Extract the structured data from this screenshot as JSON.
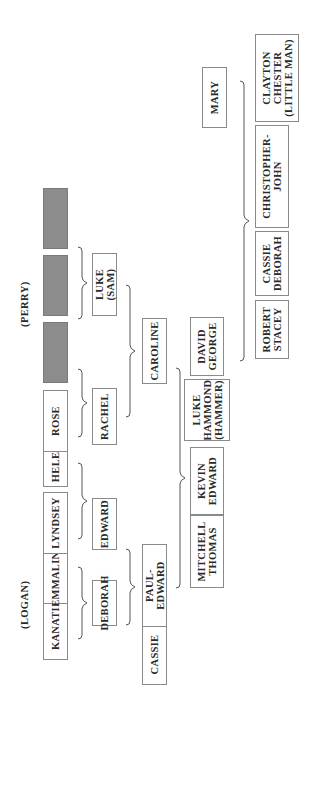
{
  "family_labels": {
    "logan": "(LOGAN)",
    "perry": "(PERRY)"
  },
  "generation_1": [
    {
      "id": "kanati",
      "label": "KANATI"
    },
    {
      "id": "emmaline",
      "label": "EMMALINE"
    },
    {
      "id": "lyndsey",
      "label": "LYNDSEY"
    },
    {
      "id": "helen",
      "label": "HELEN"
    },
    {
      "id": "rose",
      "label": "ROSE"
    },
    {
      "id": "unknown-1",
      "label": ""
    },
    {
      "id": "unknown-2",
      "label": ""
    },
    {
      "id": "unknown-3",
      "label": ""
    }
  ],
  "generation_2": [
    {
      "id": "deborah",
      "label": "DEBORAH"
    },
    {
      "id": "edward",
      "label": "EDWARD"
    },
    {
      "id": "rachel",
      "label": "RACHEL"
    },
    {
      "id": "luke-sam",
      "label": "LUKE (SAM)"
    }
  ],
  "generation_3": [
    {
      "id": "cassie",
      "label": "CASSIE"
    },
    {
      "id": "paul-edward",
      "label": "PAUL-EDWARD"
    },
    {
      "id": "caroline",
      "label": "CAROLINE"
    }
  ],
  "generation_4": [
    {
      "id": "mitchell-thomas",
      "label": "MITCHELL\nTHOMAS"
    },
    {
      "id": "kevin-edward",
      "label": "KEVIN\nEDWARD"
    },
    {
      "id": "luke-hammond",
      "label": "LUKE\nHAMMOND\n(HAMMER)"
    },
    {
      "id": "david-george",
      "label": "DAVID\nGEORGE"
    }
  ],
  "generation_5": [
    {
      "id": "robert-stacey",
      "label": "ROBERT\nSTACEY"
    },
    {
      "id": "cassie-deborah",
      "label": "CASSIE\nDEBORAH"
    },
    {
      "id": "christopher-john",
      "label": "CHRISTOPHER-\nJOHN"
    },
    {
      "id": "mary",
      "label": "MARY"
    },
    {
      "id": "clayton-chester",
      "label": "CLAYTON\nCHESTER\n(LITTLE MAN)"
    }
  ]
}
